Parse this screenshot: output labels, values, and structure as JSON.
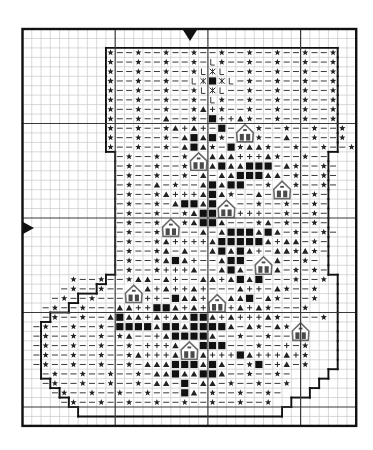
{
  "chart_data": {
    "type": "table",
    "grid": {
      "cols": 36,
      "rows": 42,
      "origin_x": 22.5,
      "origin_y": 29,
      "cell_w": 9.27,
      "cell_h": 9.45,
      "major_every": 10
    },
    "colors": {
      "grid_minor": "#c8c8c8",
      "grid_major": "#3a3a3a",
      "frame": "#111111",
      "outline": "#111111",
      "symbol": "#222222",
      "house_outline": "#6a6a6a",
      "house_window": "#4a4a4a"
    },
    "legend_symbols": {
      "*": "star",
      "-": "dash",
      "A": "triangle",
      "+": "plus",
      "#": "filled-square",
      "L": "letter-L",
      "X": "asterisk-x"
    },
    "rows": [
      "                                    ",
      "                                    ",
      "         *--*--*--*--*--*--*--*--*  ",
      "         *--*--*--*-L*--*--*--*--*  ",
      "         *--*--*--*LXL--*--*--*--*  ",
      "         *--*--*--LX#XL-*--*--*--*  ",
      "         *--*--*--*LXL--*--*--*--*  ",
      "         *--*--*--*-L*--*--*--*--*  ",
      "         *--*--*--*A+*--*--*--*--*  ",
      "         *--*--A--*-#++A*--*--*--*  ",
      "         *--*--*A+A+-#---*--*--*--*  ",
      "         *--*--*-A#A#*---*--A--*--*  ",
      "         *--*--*-A#A*-#*AA*--*--*--*  ",
      "          -*--*--*-#AAA+++A*--*--   ",
      "          -*--*--*--A#AA###-A*--*-  ",
      "          -*--*--*-A-AA###AA-*--*-  ",
      "          -*--A-*--A#A##--*--*--*-  ",
      "          -*--*A+++A#A*--A--*--*-  ",
      "          -*--*-A##A###--*--*--*-  ",
      "          -*--*--*A##AA+++--*--*-  ",
      "          -*--*--*A##A---*A-*--*-  ",
      "          -*--*-A--A-A###A#A-*--*-  ",
      "          -*--*A++++A#####A+AA-*-  ",
      "          -*--*A-A--A#A#A+-AA*A*-  ",
      "          -*--*A#A+--A##-A-A--*-  ",
      "          -*--*+++A--A#A--AA-*-*-  ",
      "     *--*--*AA-A+--AA+A#A#---*--*  ",
      "    -*--*---AA+A++A+---A++-A*--*  ",
      "   -*--*---A+++-#AA+++AA#-A*---*  ",
      "  -*--*---AA++##A+A++A+A+A*---*   ",
      "  -*--*--A#AA+A+AA##A+A+++A*----*  ",
      " -*--*--*-####A##A####A-A*-A*-*  ",
      " -*--*--*-*A--+A####A--*--*---*  ",
      " -*--*--*--*-+++AA####---*--+-*  ",
      " -*--*--*--*A+++A#AA+++#A+++A+*  ",
      " -*--*--*--*-AAA###A#A--*#-+A-*  ",
      "  -*--*--*--*-AA#AA##A--*--*-   ",
      "  -*--*--*--*-AA-#-AA-*--*--*   ",
      "   -*--*--*--*---#A-*--*--*-    ",
      "    -*--*--*--*--*--*--*--*     ",
      "                                    ",
      "                                    "
    ],
    "outline_rows": [
      [
        2,
        9,
        33
      ],
      [
        3,
        9,
        33
      ],
      [
        4,
        9,
        33
      ],
      [
        5,
        9,
        33
      ],
      [
        6,
        9,
        33
      ],
      [
        7,
        9,
        33
      ],
      [
        8,
        9,
        33
      ],
      [
        9,
        9,
        33
      ],
      [
        10,
        9,
        33
      ],
      [
        11,
        9,
        33
      ],
      [
        12,
        9,
        33
      ],
      [
        13,
        10,
        32
      ],
      [
        14,
        10,
        32
      ],
      [
        15,
        10,
        32
      ],
      [
        16,
        10,
        32
      ],
      [
        17,
        10,
        32
      ],
      [
        18,
        10,
        32
      ],
      [
        19,
        10,
        32
      ],
      [
        20,
        10,
        32
      ],
      [
        21,
        10,
        32
      ],
      [
        22,
        10,
        32
      ],
      [
        23,
        10,
        32
      ],
      [
        24,
        10,
        32
      ],
      [
        25,
        10,
        32
      ],
      [
        26,
        9,
        33
      ],
      [
        27,
        8,
        33
      ],
      [
        28,
        6,
        33
      ],
      [
        29,
        5,
        33
      ],
      [
        30,
        3,
        33
      ],
      [
        31,
        2,
        33
      ],
      [
        32,
        2,
        33
      ],
      [
        33,
        2,
        33
      ],
      [
        34,
        2,
        33
      ],
      [
        35,
        2,
        33
      ],
      [
        36,
        2,
        32
      ],
      [
        37,
        3,
        31
      ],
      [
        38,
        4,
        30
      ],
      [
        39,
        5,
        28
      ],
      [
        40,
        6,
        27
      ]
    ],
    "houses": [
      {
        "col": 23,
        "row": 10
      },
      {
        "col": 18,
        "row": 13
      },
      {
        "col": 27,
        "row": 16
      },
      {
        "col": 21,
        "row": 18
      },
      {
        "col": 15,
        "row": 20
      },
      {
        "col": 25,
        "row": 24
      },
      {
        "col": 11,
        "row": 27
      },
      {
        "col": 20,
        "row": 28
      },
      {
        "col": 29,
        "row": 31
      },
      {
        "col": 17,
        "row": 33
      }
    ],
    "markers": [
      {
        "position": "top-center",
        "shape": "down-triangle"
      },
      {
        "position": "left-middle",
        "shape": "right-triangle"
      }
    ]
  }
}
